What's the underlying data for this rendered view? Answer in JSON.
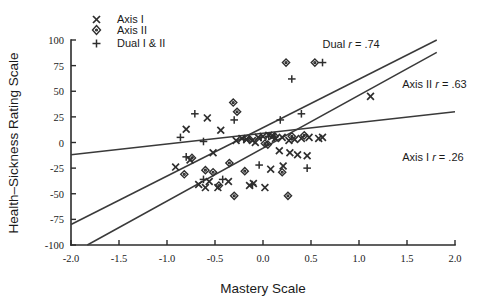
{
  "chart_data": {
    "type": "scatter",
    "title": "",
    "xlabel": "Mastery Scale",
    "ylabel": "Health–Sickness Rating Scale",
    "xlim": [
      -2.0,
      2.0
    ],
    "ylim": [
      -100,
      100
    ],
    "xticks": [
      -2.0,
      -1.5,
      -1.0,
      -0.5,
      0.0,
      0.5,
      1.0,
      1.5,
      2.0
    ],
    "xticklabels": [
      "-2.0",
      "-1.5",
      "-1.0",
      "-0.5",
      "0.0",
      "0.5",
      "1.0",
      "1.5",
      "2.0"
    ],
    "yticks": [
      -100,
      -75,
      -50,
      -25,
      0,
      25,
      50,
      75,
      100
    ],
    "yticklabels": [
      "-100",
      "-75",
      "-50",
      "-25",
      "0",
      "25",
      "50",
      "75",
      "100"
    ],
    "grid": false,
    "legend_position": "top-left",
    "legend": [
      {
        "label": "Axis I",
        "marker": "x"
      },
      {
        "label": "Axis II",
        "marker": "diamond"
      },
      {
        "label": "Dual I & II",
        "marker": "plus"
      }
    ],
    "annotations": [
      {
        "id": "dual",
        "text_plain": "Dual r = .74",
        "prefix": "Dual ",
        "italic": "r",
        "suffix": " = .74",
        "x": 0.62,
        "y": 92
      },
      {
        "id": "axis2",
        "text_plain": "Axis II r = .63",
        "prefix": "Axis II ",
        "italic": "r",
        "suffix": " = .63",
        "x": 1.45,
        "y": 53
      },
      {
        "id": "axis1",
        "text_plain": "Axis I r = .26",
        "prefix": "Axis I ",
        "italic": "r",
        "suffix": " = .26",
        "x": 1.45,
        "y": -18
      }
    ],
    "regression_lines": [
      {
        "name": "Axis I",
        "r": 0.26,
        "x0": -2.0,
        "y0": -12,
        "x1": 2.0,
        "y1": 30
      },
      {
        "name": "Axis II",
        "r": 0.63,
        "x0": -1.83,
        "y0": -100,
        "x1": 1.81,
        "y1": 88
      },
      {
        "name": "Dual I & II",
        "r": 0.74,
        "x0": -2.0,
        "y0": -80,
        "x1": 1.81,
        "y1": 100
      }
    ],
    "series": [
      {
        "name": "Axis I",
        "marker": "x",
        "points": [
          [
            -0.8,
            13
          ],
          [
            -0.58,
            24
          ],
          [
            -0.44,
            12
          ],
          [
            -0.28,
            2
          ],
          [
            -0.22,
            4
          ],
          [
            -0.17,
            3
          ],
          [
            -0.11,
            2
          ],
          [
            -0.08,
            0
          ],
          [
            -0.05,
            5
          ],
          [
            0.0,
            6
          ],
          [
            0.06,
            7
          ],
          [
            0.1,
            6
          ],
          [
            0.13,
            4
          ],
          [
            0.2,
            5
          ],
          [
            0.27,
            2
          ],
          [
            0.33,
            3
          ],
          [
            0.4,
            4
          ],
          [
            0.48,
            5
          ],
          [
            0.58,
            4
          ],
          [
            0.62,
            5
          ],
          [
            0.17,
            -8
          ],
          [
            0.28,
            -10
          ],
          [
            0.36,
            -12
          ],
          [
            0.46,
            -13
          ],
          [
            0.21,
            -23
          ],
          [
            1.12,
            45
          ],
          [
            -0.91,
            -24
          ],
          [
            -0.76,
            -17
          ],
          [
            -0.56,
            -38
          ],
          [
            -0.36,
            -38
          ],
          [
            -0.14,
            -42
          ],
          [
            -0.1,
            -40
          ],
          [
            -0.47,
            -44
          ],
          [
            0.02,
            -44
          ],
          [
            -0.67,
            -41
          ],
          [
            -0.6,
            -44
          ],
          [
            0.08,
            -26
          ],
          [
            -0.52,
            -10
          ]
        ]
      },
      {
        "name": "Axis II",
        "marker": "diamond",
        "points": [
          [
            0.24,
            78
          ],
          [
            0.54,
            78
          ],
          [
            -0.31,
            39
          ],
          [
            -0.27,
            30
          ],
          [
            0.12,
            6
          ],
          [
            0.3,
            6
          ],
          [
            0.43,
            7
          ],
          [
            -0.14,
            3
          ],
          [
            0.02,
            -1
          ],
          [
            0.05,
            -2
          ],
          [
            -0.35,
            -20
          ],
          [
            -0.6,
            -27
          ],
          [
            -0.19,
            -28
          ],
          [
            -0.82,
            -31
          ],
          [
            -0.52,
            -29
          ],
          [
            -0.46,
            -42
          ],
          [
            -0.3,
            -52
          ],
          [
            0.26,
            -52
          ],
          [
            0.2,
            -29
          ],
          [
            -0.74,
            -15
          ]
        ]
      },
      {
        "name": "Dual I & II",
        "marker": "plus",
        "points": [
          [
            0.62,
            78
          ],
          [
            0.3,
            62
          ],
          [
            -0.71,
            28
          ],
          [
            -0.3,
            22
          ],
          [
            -0.86,
            5
          ],
          [
            -0.2,
            3
          ],
          [
            -0.02,
            5
          ],
          [
            0.06,
            6
          ],
          [
            0.12,
            5
          ],
          [
            0.4,
            28
          ],
          [
            0.18,
            22
          ],
          [
            -0.62,
            1
          ],
          [
            -0.8,
            -14
          ],
          [
            -0.62,
            -36
          ],
          [
            -0.42,
            -36
          ],
          [
            0.46,
            -25
          ],
          [
            -0.04,
            -22
          ],
          [
            -0.11,
            -41
          ]
        ]
      }
    ]
  }
}
